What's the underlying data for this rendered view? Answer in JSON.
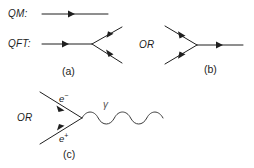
{
  "figure": {
    "background_color": "#ffffff",
    "line_color": "#1f1f1f",
    "wave_color": "#3a3a3a",
    "gamma_color": "#555555",
    "width": 254,
    "height": 168
  },
  "labels": {
    "qm": "QM:",
    "qft": "QFT:",
    "or_b": "OR",
    "or_c": "OR",
    "caption_a": "(a)",
    "caption_b": "(b)",
    "caption_c": "(c)",
    "electron": "e",
    "electron_charge": "−",
    "positron": "e",
    "positron_charge": "+",
    "photon": "γ"
  },
  "diagram_a": {
    "name": "qm-qft-vertex",
    "qm_line": {
      "x1": 42,
      "y1": 14,
      "x2": 108,
      "y2": 14,
      "arrow_at": 0.46
    },
    "qft_incoming": {
      "x1": 42,
      "y1": 44,
      "x2": 92,
      "y2": 44,
      "arrow_at": 0.45
    },
    "qft_out_upper": {
      "x1": 92,
      "y1": 44,
      "x2": 122,
      "y2": 27,
      "arrow_at": 0.62
    },
    "qft_out_lower": {
      "x1": 92,
      "y1": 44,
      "x2": 122,
      "y2": 63,
      "arrow_at": 0.62
    }
  },
  "diagram_b": {
    "name": "reversed-vertex",
    "in_upper": {
      "x1": 165,
      "y1": 26,
      "x2": 197,
      "y2": 45,
      "arrow_at": 0.48
    },
    "in_lower": {
      "x1": 165,
      "y1": 64,
      "x2": 197,
      "y2": 45,
      "arrow_at": 0.48
    },
    "outgoing": {
      "x1": 197,
      "y1": 45,
      "x2": 243,
      "y2": 45,
      "arrow_at": 0.55
    }
  },
  "diagram_c": {
    "name": "electron-positron-annihilation",
    "electron_line": {
      "x1": 40,
      "y1": 92,
      "x2": 82,
      "y2": 118,
      "arrow_at": 0.52
    },
    "positron_line": {
      "x1": 40,
      "y1": 144,
      "x2": 82,
      "y2": 118,
      "arrow_at": 0.52
    },
    "photon_wave": {
      "x1": 82,
      "y1": 118,
      "x2": 163,
      "y2": 118,
      "cycles": 5,
      "amplitude": 6
    }
  }
}
